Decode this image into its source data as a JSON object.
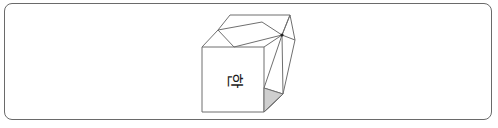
{
  "figure": {
    "type": "folded-paper-cube",
    "front_face_label": "한",
    "label_rotation_deg": 90,
    "colors": {
      "stroke": "#6f6f6f",
      "frame": "#6a6a6a",
      "shaded_face": "#cfcfcf",
      "background": "#ffffff"
    }
  }
}
